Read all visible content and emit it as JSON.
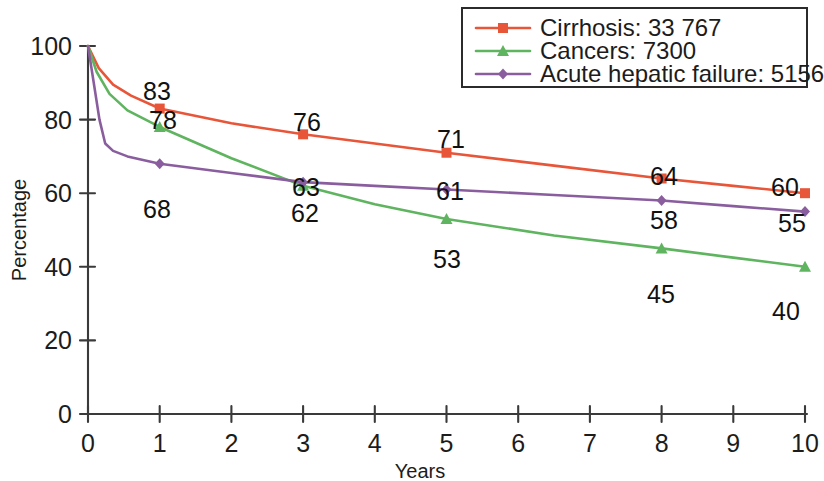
{
  "chart_data": {
    "type": "line",
    "title": "",
    "xlabel": "Years",
    "ylabel": "Percentage",
    "xlim": [
      0,
      10
    ],
    "ylim": [
      0,
      100
    ],
    "grid": false,
    "legend_position": "top-right",
    "x_ticks": [
      "0",
      "1",
      "2",
      "3",
      "4",
      "5",
      "6",
      "7",
      "8",
      "9",
      "10"
    ],
    "x_tick_values": [
      0,
      1,
      2,
      3,
      4,
      5,
      6,
      7,
      8,
      9,
      10
    ],
    "y_ticks": [
      "0",
      "20",
      "40",
      "60",
      "80",
      "100"
    ],
    "y_tick_values": [
      0,
      20,
      40,
      60,
      80,
      100
    ],
    "series": [
      {
        "name": "Cirrhosis",
        "legend_label": "Cirrhosis: 33 767",
        "count": "33 767",
        "color": "#E8563A",
        "marker": "square",
        "x": [
          0,
          1,
          3,
          5,
          8,
          10
        ],
        "values": [
          100,
          83,
          76,
          71,
          64,
          60
        ],
        "labels": [
          "",
          "83",
          "76",
          "71",
          "64",
          "60"
        ],
        "curve_x": [
          0,
          0.15,
          0.35,
          0.6,
          1,
          2,
          3,
          4,
          5,
          6.5,
          8,
          9,
          10
        ],
        "curve_y": [
          100,
          94,
          89.5,
          86.5,
          83,
          79,
          76,
          73.5,
          71,
          67.5,
          64,
          62,
          60
        ]
      },
      {
        "name": "Cancers",
        "legend_label": "Cancers: 7300",
        "count": "7300",
        "color": "#5FB45F",
        "marker": "triangle",
        "x": [
          0,
          1,
          3,
          5,
          8,
          10
        ],
        "values": [
          100,
          78,
          62,
          53,
          45,
          40
        ],
        "labels": [
          "",
          "78",
          "62",
          "53",
          "45",
          "40"
        ],
        "curve_x": [
          0,
          0.12,
          0.3,
          0.55,
          1,
          2,
          3,
          4,
          5,
          6.5,
          8,
          9,
          10
        ],
        "curve_y": [
          100,
          93,
          87,
          82.5,
          78,
          69.5,
          62,
          57,
          53,
          48.5,
          45,
          42.5,
          40
        ]
      },
      {
        "name": "Acute hepatic failure",
        "legend_label": "Acute hepatic failure: 5156",
        "count": "5156",
        "color": "#8A5E9E",
        "marker": "diamond",
        "x": [
          0,
          1,
          3,
          5,
          8,
          10
        ],
        "values": [
          100,
          68,
          63,
          61,
          58,
          55
        ],
        "labels": [
          "",
          "68",
          "63",
          "61",
          "58",
          "55"
        ],
        "curve_x": [
          0,
          0.08,
          0.16,
          0.24,
          0.35,
          0.55,
          1,
          2,
          3,
          4,
          5,
          6.5,
          8,
          9,
          10
        ],
        "curve_y": [
          100,
          90,
          80,
          73.5,
          71.5,
          70,
          68,
          65.5,
          63,
          62,
          61,
          59.5,
          58,
          56.5,
          55
        ]
      }
    ],
    "annotations": [
      {
        "series": "Cirrhosis",
        "x": 1,
        "value": 83,
        "text": "83"
      },
      {
        "series": "Cirrhosis",
        "x": 3,
        "value": 76,
        "text": "76"
      },
      {
        "series": "Cirrhosis",
        "x": 5,
        "value": 71,
        "text": "71"
      },
      {
        "series": "Cirrhosis",
        "x": 8,
        "value": 64,
        "text": "64"
      },
      {
        "series": "Cirrhosis",
        "x": 10,
        "value": 60,
        "text": "60"
      },
      {
        "series": "Cancers",
        "x": 1,
        "value": 78,
        "text": "78"
      },
      {
        "series": "Cancers",
        "x": 3,
        "value": 62,
        "text": "62"
      },
      {
        "series": "Cancers",
        "x": 5,
        "value": 53,
        "text": "53"
      },
      {
        "series": "Cancers",
        "x": 8,
        "value": 45,
        "text": "45"
      },
      {
        "series": "Cancers",
        "x": 10,
        "value": 40,
        "text": "40"
      },
      {
        "series": "Acute hepatic failure",
        "x": 1,
        "value": 68,
        "text": "68"
      },
      {
        "series": "Acute hepatic failure",
        "x": 3,
        "value": 63,
        "text": "63"
      },
      {
        "series": "Acute hepatic failure",
        "x": 5,
        "value": 61,
        "text": "61"
      },
      {
        "series": "Acute hepatic failure",
        "x": 8,
        "value": 58,
        "text": "58"
      },
      {
        "series": "Acute hepatic failure",
        "x": 10,
        "value": 55,
        "text": "55"
      }
    ]
  },
  "label_positions": [
    {
      "name": "cirrhosis-1",
      "text": "83",
      "x": 157,
      "y": 100,
      "anchor": "middle"
    },
    {
      "name": "cirrhosis-3",
      "text": "76",
      "x": 307,
      "y": 131,
      "anchor": "middle"
    },
    {
      "name": "cirrhosis-5",
      "text": "71",
      "x": 451,
      "y": 148,
      "anchor": "middle"
    },
    {
      "name": "cirrhosis-8",
      "text": "64",
      "x": 664,
      "y": 185,
      "anchor": "middle"
    },
    {
      "name": "cirrhosis-10",
      "text": "60",
      "x": 785,
      "y": 196,
      "anchor": "middle"
    },
    {
      "name": "cancers-1",
      "text": "78",
      "x": 163,
      "y": 129,
      "anchor": "middle"
    },
    {
      "name": "cancers-3",
      "text": "62",
      "x": 305,
      "y": 222,
      "anchor": "middle"
    },
    {
      "name": "cancers-5",
      "text": "53",
      "x": 447,
      "y": 268,
      "anchor": "middle"
    },
    {
      "name": "cancers-8",
      "text": "45",
      "x": 661,
      "y": 303,
      "anchor": "middle"
    },
    {
      "name": "cancers-10",
      "text": "40",
      "x": 786,
      "y": 320,
      "anchor": "middle"
    },
    {
      "name": "ahf-1",
      "text": "68",
      "x": 157,
      "y": 218,
      "anchor": "middle"
    },
    {
      "name": "ahf-3",
      "text": "63",
      "x": 306,
      "y": 196,
      "anchor": "middle"
    },
    {
      "name": "ahf-5",
      "text": "61",
      "x": 450,
      "y": 200,
      "anchor": "middle"
    },
    {
      "name": "ahf-8",
      "text": "58",
      "x": 664,
      "y": 229,
      "anchor": "middle"
    },
    {
      "name": "ahf-10",
      "text": "55",
      "x": 792,
      "y": 232,
      "anchor": "middle"
    }
  ]
}
